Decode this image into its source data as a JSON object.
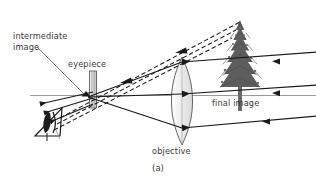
{
  "figure": {
    "caption": "(a)",
    "background_color": "#ffffff",
    "ink_color": "#1a1a1a",
    "label_color": "#3a3a3a",
    "axis_color": "#8a8a8a",
    "width": 316,
    "height": 184
  },
  "labels": {
    "intermediate_image": "intermediate image",
    "eyepiece": "eyepiece",
    "final_image": "final image",
    "objective": "objective"
  },
  "diagram_data": {
    "type": "optical-ray-diagram",
    "title": "Astronomical refracting telescope ray diagram",
    "components": [
      {
        "name": "objective",
        "kind": "converging-lens",
        "center_x": 182,
        "center_y": 101,
        "half_height": 44,
        "half_width": 10,
        "label": "objective"
      },
      {
        "name": "eyepiece",
        "kind": "converging-lens",
        "center_x": 93,
        "center_y": 90,
        "half_height": 19,
        "half_width": 3,
        "label": "eyepiece"
      },
      {
        "name": "eye",
        "kind": "observer-eye",
        "center_x": 47,
        "center_y": 121
      },
      {
        "name": "object-tree",
        "kind": "tree",
        "base_x": 240,
        "base_y": 110,
        "top_y": 20,
        "label": "final image"
      },
      {
        "name": "optical-axis",
        "kind": "axis-line",
        "x1": 30,
        "y1": 95,
        "x2": 316,
        "y2": 95
      },
      {
        "name": "intermediate-image-point",
        "kind": "image-point",
        "x": 88,
        "y": 97,
        "label": "intermediate image"
      }
    ],
    "ray_bundles": [
      {
        "name": "upper-incoming-ray",
        "style": "solid",
        "arrow": "leftward",
        "points": [
          [
            316,
            57
          ],
          [
            182,
            63
          ],
          [
            88,
            97
          ]
        ]
      },
      {
        "name": "middle-incoming-ray",
        "style": "solid",
        "arrow": "leftward",
        "points": [
          [
            316,
            88
          ],
          [
            182,
            95
          ],
          [
            88,
            97
          ]
        ]
      },
      {
        "name": "lower-incoming-ray",
        "style": "solid",
        "arrow": "leftward",
        "points": [
          [
            316,
            117
          ],
          [
            182,
            127
          ],
          [
            88,
            97
          ]
        ]
      },
      {
        "name": "emergent-rays-to-eye",
        "style": "solid",
        "arrow": "leftward",
        "count": 3
      },
      {
        "name": "virtual-image-construction-rays",
        "style": "dashed",
        "arrow": "leftward",
        "note": "extend back from eyepiece to the top of the distant virtual image"
      }
    ],
    "annotations": [
      {
        "name": "leader-line-intermediate-image",
        "from": [
          36,
          44
        ],
        "to": [
          86,
          96
        ]
      }
    ]
  }
}
